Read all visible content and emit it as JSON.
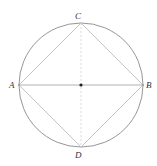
{
  "diagram": {
    "center": {
      "x": 81,
      "y": 85
    },
    "radius": 62,
    "colors": {
      "circle": "#8a8a8a",
      "square": "#c4c4c4",
      "diameter_ab": "#a8a8a8",
      "diameter_cd_dashed": "#cfcfcf",
      "center_dot": "#222222",
      "labels": "#333333"
    },
    "points": [
      {
        "name": "A",
        "x": 19,
        "y": 85,
        "label_x": 9,
        "label_y": 88
      },
      {
        "name": "B",
        "x": 143,
        "y": 85,
        "label_x": 146,
        "label_y": 88
      },
      {
        "name": "C",
        "x": 81,
        "y": 23,
        "label_x": 75,
        "label_y": 19
      },
      {
        "name": "D",
        "x": 81,
        "y": 147,
        "label_x": 75,
        "label_y": 158
      }
    ],
    "labels": {
      "A": "A",
      "B": "B",
      "C": "C",
      "D": "D"
    }
  }
}
